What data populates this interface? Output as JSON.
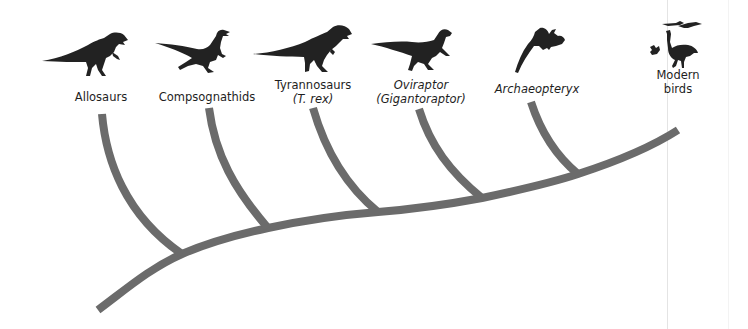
{
  "diagram": {
    "type": "cladogram",
    "colors": {
      "branch": "#6b6b6b",
      "silhouette": "#222222",
      "label_text": "#1e1e1e",
      "background": "#ffffff"
    },
    "taxa": [
      {
        "id": "allosaurs",
        "line1": "Allosaurs",
        "line2": "",
        "italic1": false,
        "italic2": false,
        "icon": "allosaurus-silhouette-icon"
      },
      {
        "id": "compsognathids",
        "line1": "Compsognathids",
        "line2": "",
        "italic1": false,
        "italic2": false,
        "icon": "compsognathus-silhouette-icon"
      },
      {
        "id": "tyrannosaurs",
        "line1": "Tyrannosaurs",
        "line2": "(T. rex)",
        "italic1": false,
        "italic2": true,
        "icon": "tyrannosaurus-silhouette-icon"
      },
      {
        "id": "oviraptor",
        "line1": "Oviraptor",
        "line2": "(Gigantoraptor)",
        "italic1": true,
        "italic2": true,
        "icon": "oviraptor-silhouette-icon"
      },
      {
        "id": "archaeopteryx",
        "line1": "Archaeopteryx",
        "line2": "",
        "italic1": true,
        "italic2": false,
        "icon": "archaeopteryx-silhouette-icon"
      },
      {
        "id": "modern-birds",
        "line1": "Modern",
        "line2": "birds",
        "italic1": false,
        "italic2": false,
        "icon": "modern-birds-silhouette-icon"
      }
    ]
  }
}
